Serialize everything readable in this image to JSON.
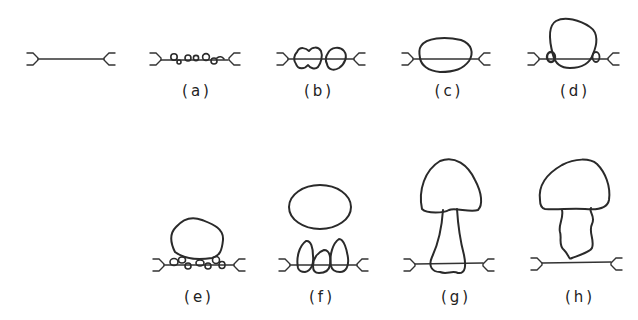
{
  "figure": {
    "type": "stage-sequence diagram",
    "rows": 2,
    "panels": [
      {
        "id": "base",
        "label": "",
        "description": "membrane segment between two forked anchors"
      },
      {
        "id": "a",
        "label": "(a)",
        "description": "small vesicles along membrane"
      },
      {
        "id": "b",
        "label": "(b)",
        "description": "two merged larger vesicles"
      },
      {
        "id": "c",
        "label": "(c)",
        "description": "single large fused body on membrane"
      },
      {
        "id": "d",
        "label": "(d)",
        "description": "large body with small side vesicles"
      },
      {
        "id": "e",
        "label": "(e)",
        "description": "large body sitting on row of small vesicles"
      },
      {
        "id": "f",
        "label": "(f)",
        "description": "detached oval above three teardrop vesicles"
      },
      {
        "id": "g",
        "label": "(g)",
        "description": "mushroom shape with stalk crossing membrane"
      },
      {
        "id": "h",
        "label": "(h)",
        "description": "mushroom shape with irregular stalk above membrane"
      }
    ]
  },
  "colors": {
    "stroke": "#2a2a2a",
    "background": "#ffffff"
  }
}
